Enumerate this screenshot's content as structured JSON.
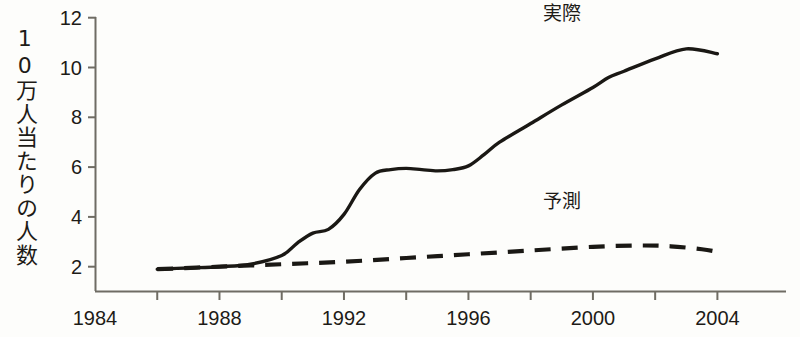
{
  "chart_data": {
    "type": "line",
    "title": "",
    "subtitle": "",
    "xlabel": "",
    "ylabel": "10万人当たりの人数",
    "xlim": [
      1984,
      2005
    ],
    "ylim": [
      1.2,
      12.4
    ],
    "grid": false,
    "legend_position": "inline-annotation",
    "x_ticks_major": [
      1984,
      1988,
      1992,
      1996,
      2000,
      2004
    ],
    "x_ticks_minor": [
      1986,
      1990,
      1994,
      1998,
      2002
    ],
    "x_tick_labels": [
      "1984",
      "1988",
      "1992",
      "1996",
      "2000",
      "2004"
    ],
    "y_ticks": [
      2,
      4,
      6,
      8,
      10,
      12
    ],
    "y_tick_labels": [
      "2",
      "4",
      "6",
      "8",
      "10",
      "12"
    ],
    "series": [
      {
        "name": "実際",
        "style": "solid",
        "color": "#1a1814",
        "label_x": 1999.0,
        "label_y": 11.9,
        "x": [
          1986,
          1987,
          1988,
          1989,
          1990,
          1990.5,
          1991,
          1991.5,
          1992,
          1992.5,
          1993,
          1993.5,
          1994,
          1994.5,
          1995,
          1995.5,
          1996,
          1996.5,
          1997,
          1998,
          1999,
          2000,
          2000.5,
          2001,
          2002,
          2003,
          2004
        ],
        "y": [
          1.9,
          1.95,
          2.0,
          2.1,
          2.45,
          2.95,
          3.35,
          3.5,
          4.1,
          5.1,
          5.75,
          5.9,
          5.95,
          5.9,
          5.85,
          5.9,
          6.05,
          6.5,
          7.0,
          7.75,
          8.5,
          9.2,
          9.6,
          9.85,
          10.35,
          10.75,
          10.55
        ]
      },
      {
        "name": "予測",
        "style": "dashed",
        "color": "#1a1814",
        "label_x": 1999.0,
        "label_y": 4.35,
        "x": [
          1986,
          1988,
          1990,
          1992,
          1994,
          1996,
          1998,
          2000,
          2001.5,
          2002.5,
          2003.5,
          2004
        ],
        "y": [
          1.9,
          2.0,
          2.1,
          2.2,
          2.35,
          2.5,
          2.65,
          2.8,
          2.85,
          2.82,
          2.7,
          2.6
        ]
      }
    ],
    "annotations": [
      {
        "text": "実際",
        "x": 1999.0,
        "y": 11.9
      },
      {
        "text": "予測",
        "x": 1999.0,
        "y": 4.35
      }
    ]
  },
  "figure": {
    "background_color": "#fdfdfb",
    "ink_color": "#1a1814",
    "axis_color": "#6f6c64",
    "bottom_cropped_caption": ""
  }
}
